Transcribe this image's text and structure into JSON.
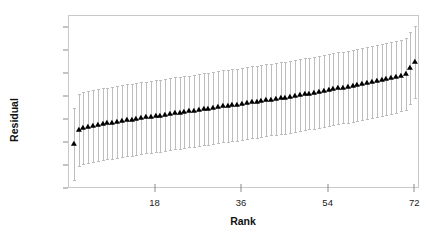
{
  "chart_data": {
    "type": "scatter",
    "title": "",
    "xlabel": "Rank",
    "ylabel": "Residual",
    "xlim": [
      0,
      73
    ],
    "ylim": [
      -2.0,
      1.75
    ],
    "grid": false,
    "legend": null,
    "marker": "triangle-up",
    "marker_color": "#000000",
    "errorbar_color": "#bdbdbd",
    "errorbar_halfwidth": 0.78,
    "xticks": [
      18,
      36,
      54,
      72
    ],
    "xticklabels": [
      "18",
      "36",
      "54",
      "72"
    ],
    "yticks": [
      1.5,
      1.0,
      0.5,
      0,
      -0.5,
      -1.0,
      -1.5,
      -2.0
    ],
    "yticklabels": [
      "1.5",
      "1.0",
      "0.5",
      "0",
      "-0.5",
      "-1.0",
      "-1.5",
      "-2.0"
    ],
    "x": [
      1,
      2,
      3,
      4,
      5,
      6,
      7,
      8,
      9,
      10,
      11,
      12,
      13,
      14,
      15,
      16,
      17,
      18,
      19,
      20,
      21,
      22,
      23,
      24,
      25,
      26,
      27,
      28,
      29,
      30,
      31,
      32,
      33,
      34,
      35,
      36,
      37,
      38,
      39,
      40,
      41,
      42,
      43,
      44,
      45,
      46,
      47,
      48,
      49,
      50,
      51,
      52,
      53,
      54,
      55,
      56,
      57,
      58,
      59,
      60,
      61,
      62,
      63,
      64,
      65,
      66,
      67,
      68,
      69,
      70,
      71,
      72
    ],
    "values": [
      -1.02,
      -0.72,
      -0.68,
      -0.66,
      -0.64,
      -0.62,
      -0.6,
      -0.58,
      -0.56,
      -0.55,
      -0.53,
      -0.51,
      -0.5,
      -0.48,
      -0.47,
      -0.45,
      -0.44,
      -0.42,
      -0.41,
      -0.39,
      -0.38,
      -0.36,
      -0.35,
      -0.33,
      -0.32,
      -0.3,
      -0.29,
      -0.27,
      -0.26,
      -0.24,
      -0.23,
      -0.21,
      -0.2,
      -0.18,
      -0.17,
      -0.15,
      -0.14,
      -0.12,
      -0.11,
      -0.09,
      -0.08,
      -0.06,
      -0.05,
      -0.03,
      -0.02,
      0.0,
      0.02,
      0.03,
      0.05,
      0.07,
      0.08,
      0.1,
      0.12,
      0.14,
      0.16,
      0.18,
      0.2,
      0.22,
      0.24,
      0.26,
      0.28,
      0.3,
      0.32,
      0.34,
      0.36,
      0.38,
      0.4,
      0.43,
      0.46,
      0.5,
      0.62,
      0.76
    ]
  },
  "axes": {
    "y_label": "Residual",
    "x_label": "Rank"
  }
}
